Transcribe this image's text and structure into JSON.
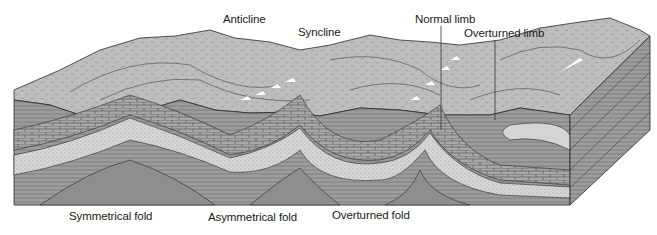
{
  "diagram": {
    "top_labels": {
      "anticline": "Anticline",
      "syncline": "Syncline",
      "normal_limb": "Normal limb",
      "overturned_limb": "Overturned limb"
    },
    "bottom_labels": {
      "symmetrical_fold": "Symmetrical fold",
      "asymmetrical_fold": "Asymmetrical fold",
      "overturned_fold": "Overturned fold"
    },
    "colors": {
      "background": "#ffffff",
      "surface_terrain": "#b8b8b8",
      "shale_layers": "#9a9a9a",
      "limestone_layers": "#a6a6a6",
      "sandstone_layers": "#d4d4d4",
      "deep_layer": "#8e8e8e",
      "outline": "#2a2a2a"
    }
  }
}
